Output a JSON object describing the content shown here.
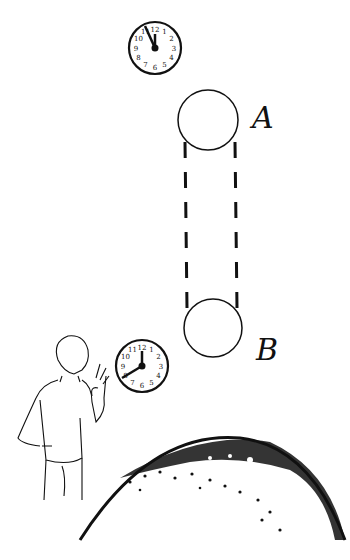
{
  "figure": {
    "labels": {
      "top_sphere": "A",
      "bottom_sphere": "B"
    },
    "clocks": [
      {
        "id": "clock-top",
        "numbers": [
          "12",
          "1",
          "2",
          "3",
          "4",
          "5",
          "6",
          "7",
          "8",
          "9",
          "10",
          "11"
        ],
        "time": "11:58"
      },
      {
        "id": "clock-bottom",
        "numbers": [
          "12",
          "1",
          "2",
          "3",
          "4",
          "5",
          "6",
          "7",
          "8",
          "9",
          "10",
          "11"
        ],
        "time": "12:40"
      }
    ],
    "colors": {
      "ink": "#111111",
      "background": "#ffffff"
    }
  }
}
